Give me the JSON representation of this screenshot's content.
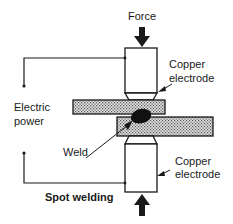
{
  "diagram": {
    "title": "Spot welding",
    "labels": {
      "force": "Force",
      "top_electrode_line1": "Copper",
      "top_electrode_line2": "electrode",
      "power_line1": "Electric",
      "power_line2": "power",
      "weld": "Weld",
      "bottom_electrode_line1": "Copper",
      "bottom_electrode_line2": "electrode"
    },
    "colors": {
      "line": "#1a1a1a",
      "plate_fill": "#c8c8c8",
      "background": "#ffffff"
    }
  }
}
